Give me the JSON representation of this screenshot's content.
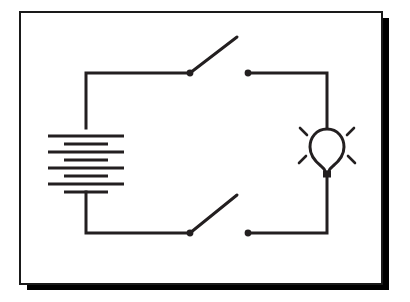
{
  "page": {
    "width": 410,
    "height": 302,
    "background_color": "#ffffff"
  },
  "frame": {
    "name": "illustration-border-frame",
    "style": "drop-shadow-box",
    "thin_edge_color": "#1a1a1a",
    "thick_edge_color": "#000000",
    "thin_edge_width": 2,
    "thick_edge_width": 7,
    "inner_left": 20,
    "inner_top": 12,
    "inner_right": 382,
    "inner_bottom": 284,
    "inner_fill": "#ffffff"
  },
  "diagram": {
    "type": "electrical-schematic",
    "line_color": "#231f20",
    "wire_width": 3,
    "components": [
      {
        "id": "battery",
        "label": "battery",
        "kind": "multi-cell-battery",
        "cell_count": 4,
        "center_x": 86,
        "top_y": 128,
        "bottom_y": 192,
        "long_plate_half_width": 38,
        "short_plate_half_width": 22
      },
      {
        "id": "switch-top",
        "label": "switch",
        "kind": "open-knife-switch",
        "state": "open",
        "pivot_x": 190,
        "pivot_y": 73,
        "lever_tip_x": 237,
        "lever_tip_y": 37,
        "contact_x": 248,
        "contact_y": 73
      },
      {
        "id": "switch-bottom",
        "label": "switch",
        "kind": "open-knife-switch",
        "state": "open",
        "pivot_x": 190,
        "pivot_y": 233,
        "lever_tip_x": 237,
        "lever_tip_y": 195,
        "contact_x": 248,
        "contact_y": 233
      },
      {
        "id": "lamp",
        "label": "light bulb",
        "kind": "incandescent-lamp",
        "state": "lit",
        "center_x": 327,
        "center_y": 147,
        "glass_radius_x": 17,
        "glass_radius_y": 19,
        "ray_count": 4
      }
    ],
    "wires": [
      {
        "id": "wire-battery-top",
        "points": "86,128 86,73 190,73"
      },
      {
        "id": "wire-top-right",
        "points": "248,73 327,73 327,128"
      },
      {
        "id": "wire-bottom-right",
        "points": "327,167 327,233 248,233"
      },
      {
        "id": "wire-battery-bottom",
        "points": "86,192 86,233 190,233"
      }
    ]
  }
}
